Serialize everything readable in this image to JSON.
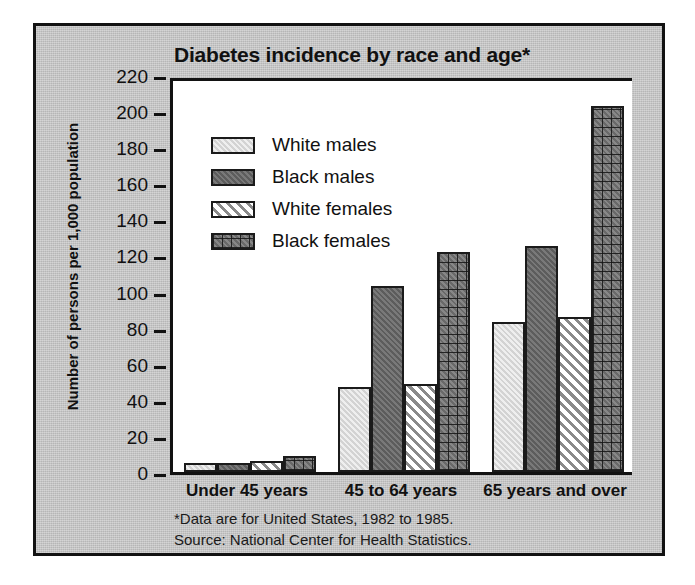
{
  "chart_data": {
    "type": "bar",
    "title": "Diabetes incidence by race and age*",
    "xlabel": "",
    "ylabel": "Number of persons per 1,000 population",
    "categories": [
      "Under 45 years",
      "45 to 64 years",
      "65 years and over"
    ],
    "series": [
      {
        "name": "White males",
        "values": [
          5,
          47,
          83
        ],
        "fill": "solid-light-gray",
        "color": "#dedede"
      },
      {
        "name": "Black males",
        "values": [
          5,
          103,
          125
        ],
        "fill": "solid-dark-gray",
        "color": "#6e6e6e"
      },
      {
        "name": "White females",
        "values": [
          6,
          49,
          86
        ],
        "fill": "diagonal-hatch",
        "color": "#e6e6e6"
      },
      {
        "name": "Black females",
        "values": [
          9,
          122,
          203
        ],
        "fill": "cross-hatch",
        "color": "#808080"
      }
    ],
    "ylim": [
      0,
      220
    ],
    "yticks": [
      0,
      20,
      40,
      60,
      80,
      100,
      120,
      140,
      160,
      180,
      200,
      220
    ],
    "grid": false,
    "legend_position": "upper-left-inside"
  },
  "footnotes": [
    "*Data are for United States, 1982 to 1985.",
    "Source: National Center for Health Statistics."
  ],
  "colors": {
    "panel_background": "#c8c8c8",
    "plot_background": "#ffffff",
    "ink": "#121212"
  }
}
